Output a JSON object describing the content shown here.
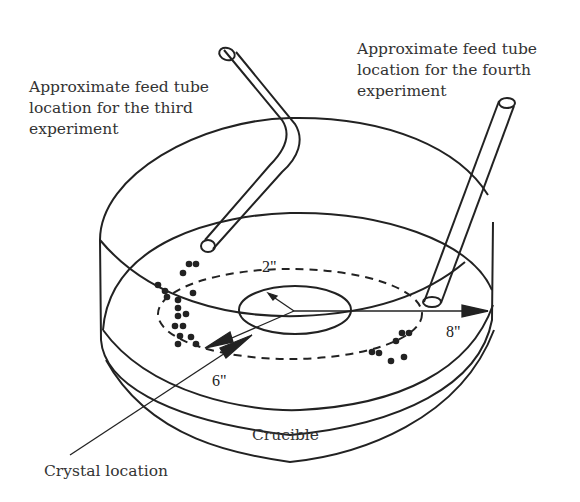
{
  "labels": {
    "third_tube": [
      "Approximate feed tube",
      "location for the third",
      "experiment"
    ],
    "fourth_tube": [
      "Approximate feed tube",
      "location for the fourth",
      "experiment"
    ],
    "crucible": "Crucible",
    "crystal": "Crystal location"
  },
  "dimensions": {
    "inner_radius": "2\"",
    "mid_radius": "6\"",
    "outer_radius": "8\""
  },
  "colors": {
    "stroke": "#222222",
    "text": "#333333",
    "background": "#ffffff"
  }
}
